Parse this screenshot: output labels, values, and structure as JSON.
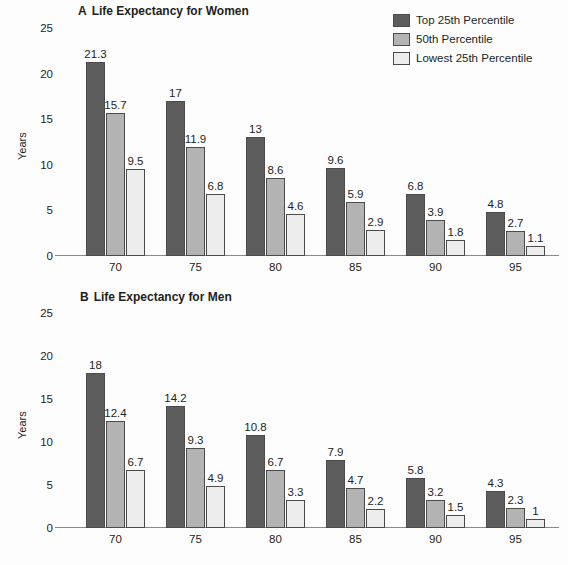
{
  "legend": {
    "items": [
      {
        "label": "Top 25th Percentile",
        "color": "#5d5d5d"
      },
      {
        "label": "50th Percentile",
        "color": "#b3b3b3"
      },
      {
        "label": "Lowest 25th Percentile",
        "color": "#ededed"
      }
    ]
  },
  "panels": {
    "a": {
      "letter": "A",
      "title": "Life Expectancy for Women"
    },
    "b": {
      "letter": "B",
      "title": "Life Expectancy for Men"
    }
  },
  "axes": {
    "ylabel": "Years",
    "xlabel": "Age, y",
    "yticks": [
      "0",
      "5",
      "10",
      "15",
      "20",
      "25"
    ],
    "xticks": [
      "70",
      "75",
      "80",
      "85",
      "90",
      "95"
    ]
  },
  "chart_data": [
    {
      "type": "bar",
      "panel": "A",
      "title": "Life Expectancy for Women",
      "xlabel": "Age, y",
      "ylabel": "Years",
      "ylim": [
        0,
        25
      ],
      "yticks": [
        0,
        5,
        10,
        15,
        20,
        25
      ],
      "grid": false,
      "legend_position": "top-right",
      "categories": [
        "70",
        "75",
        "80",
        "85",
        "90",
        "95"
      ],
      "series": [
        {
          "name": "Top 25th Percentile",
          "color": "#5d5d5d",
          "values": [
            21.3,
            17,
            13,
            9.6,
            6.8,
            4.8
          ],
          "labels": [
            "21.3",
            "17",
            "13",
            "9.6",
            "6.8",
            "4.8"
          ]
        },
        {
          "name": "50th Percentile",
          "color": "#b3b3b3",
          "values": [
            15.7,
            11.9,
            8.6,
            5.9,
            3.9,
            2.7
          ],
          "labels": [
            "15.7",
            "11.9",
            "8.6",
            "5.9",
            "3.9",
            "2.7"
          ]
        },
        {
          "name": "Lowest 25th Percentile",
          "color": "#ededed",
          "values": [
            9.5,
            6.8,
            4.6,
            2.9,
            1.8,
            1.1
          ],
          "labels": [
            "9.5",
            "6.8",
            "4.6",
            "2.9",
            "1.8",
            "1.1"
          ]
        }
      ]
    },
    {
      "type": "bar",
      "panel": "B",
      "title": "Life Expectancy for Men",
      "xlabel": "Age, y",
      "ylabel": "Years",
      "ylim": [
        0,
        25
      ],
      "yticks": [
        0,
        5,
        10,
        15,
        20,
        25
      ],
      "grid": false,
      "legend_position": "top-right",
      "categories": [
        "70",
        "75",
        "80",
        "85",
        "90",
        "95"
      ],
      "series": [
        {
          "name": "Top 25th Percentile",
          "color": "#5d5d5d",
          "values": [
            18,
            14.2,
            10.8,
            7.9,
            5.8,
            4.3
          ],
          "labels": [
            "18",
            "14.2",
            "10.8",
            "7.9",
            "5.8",
            "4.3"
          ]
        },
        {
          "name": "50th Percentile",
          "color": "#b3b3b3",
          "values": [
            12.4,
            9.3,
            6.7,
            4.7,
            3.2,
            2.3
          ],
          "labels": [
            "12.4",
            "9.3",
            "6.7",
            "4.7",
            "3.2",
            "2.3"
          ]
        },
        {
          "name": "Lowest 25th Percentile",
          "color": "#ededed",
          "values": [
            6.7,
            4.9,
            3.3,
            2.2,
            1.5,
            1
          ],
          "labels": [
            "6.7",
            "4.9",
            "3.3",
            "2.2",
            "1.5",
            "1"
          ]
        }
      ]
    }
  ]
}
